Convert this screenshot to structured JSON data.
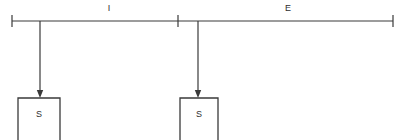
{
  "diagram": {
    "canvas": {
      "width": 411,
      "height": 140,
      "background": "#ffffff"
    },
    "stroke_color": "#3a3a3a",
    "text_color": "#2e2e2e",
    "axis": {
      "y": 21,
      "x_start": 12,
      "x_end": 393,
      "ticks": [
        {
          "name": "start-tick",
          "x": 12
        },
        {
          "name": "middle-tick",
          "x": 178
        },
        {
          "name": "end-tick",
          "x": 393
        }
      ],
      "tick_half_height": 6
    },
    "segments": [
      {
        "id": "segment-i",
        "label": "I",
        "label_x": 109,
        "label_y": 11,
        "from_x": 12,
        "to_x": 178
      },
      {
        "id": "segment-e",
        "label": "E",
        "label_x": 288,
        "label_y": 11,
        "from_x": 178,
        "to_x": 393
      }
    ],
    "nodes": [
      {
        "id": "node-left",
        "label": "S",
        "drop_line": {
          "x": 40,
          "y_top": 21,
          "y_bottom": 97
        },
        "arrow": {
          "x": 40,
          "tip_y": 97,
          "half_width": 3.2,
          "height": 7
        },
        "box": {
          "x": 18,
          "y": 98,
          "width": 42,
          "height": 42,
          "open_bottom": true
        },
        "label_x": 39,
        "label_y": 117
      },
      {
        "id": "node-right",
        "label": "S",
        "drop_line": {
          "x": 198,
          "y_top": 21,
          "y_bottom": 97
        },
        "arrow": {
          "x": 198,
          "tip_y": 97,
          "half_width": 3.2,
          "height": 7
        },
        "box": {
          "x": 180,
          "y": 98,
          "width": 38,
          "height": 42,
          "open_bottom": true
        },
        "label_x": 199,
        "label_y": 117
      }
    ]
  }
}
